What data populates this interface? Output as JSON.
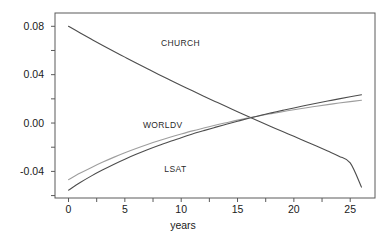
{
  "chart_data": {
    "type": "line",
    "title": "",
    "xlabel": "years",
    "ylabel": "",
    "xlim": [
      -1.2,
      27.2
    ],
    "ylim": [
      -0.062,
      0.091
    ],
    "grid": false,
    "legend": "inline-labels",
    "x_ticks": [
      0,
      5,
      10,
      15,
      20,
      25
    ],
    "x_tick_labels": [
      "0",
      "5",
      "10",
      "15",
      "20",
      "25"
    ],
    "x_minor_ticks": [
      2.5,
      7.5,
      12.5,
      17.5,
      22.5
    ],
    "y_ticks": [
      -0.04,
      0.0,
      0.04,
      0.08
    ],
    "y_tick_labels": [
      "-0.04",
      "0.00",
      "0.04",
      "0.08"
    ],
    "y_minor_ticks": [
      -0.06,
      -0.02,
      0.02,
      0.06
    ],
    "x": [
      0,
      1,
      2,
      3,
      4,
      5,
      6,
      7,
      8,
      9,
      10,
      11,
      12,
      13,
      14,
      15,
      16,
      17,
      18,
      19,
      20,
      21,
      22,
      23,
      24,
      25,
      26
    ],
    "series": [
      {
        "name": "CHURCH",
        "color": "#4d4d4d",
        "label_x": 8.2,
        "label_y": 0.0635,
        "values": [
          0.08,
          0.0747,
          0.0695,
          0.0644,
          0.0594,
          0.0545,
          0.0496,
          0.0449,
          0.0402,
          0.0356,
          0.0311,
          0.0266,
          0.0222,
          0.0179,
          0.0136,
          0.0094,
          0.0052,
          0.0011,
          -0.003,
          -0.007,
          -0.011,
          -0.015,
          -0.019,
          -0.0231,
          -0.0274,
          -0.033,
          -0.053
        ]
      },
      {
        "name": "WORLDV",
        "color": "#9e9e9e",
        "label_x": 6.6,
        "label_y": -0.0042,
        "values": [
          -0.0468,
          -0.0416,
          -0.0369,
          -0.0325,
          -0.0284,
          -0.0246,
          -0.0211,
          -0.0178,
          -0.0147,
          -0.0118,
          -0.0091,
          -0.0065,
          -0.0041,
          -0.0018,
          0.0003,
          0.0024,
          0.0043,
          0.0061,
          0.0078,
          0.0094,
          0.011,
          0.0125,
          0.0139,
          0.0152,
          0.0165,
          0.0177,
          0.0189
        ]
      },
      {
        "name": "LSAT",
        "color": "#4d4d4d",
        "label_x": 8.5,
        "label_y": -0.0405,
        "values": [
          -0.0555,
          -0.0494,
          -0.0439,
          -0.0389,
          -0.0342,
          -0.0299,
          -0.0259,
          -0.0221,
          -0.0186,
          -0.0153,
          -0.0121,
          -0.0091,
          -0.0063,
          -0.0036,
          -0.001,
          0.0015,
          0.0039,
          0.0062,
          0.0084,
          0.0105,
          0.0125,
          0.0145,
          0.0164,
          0.0182,
          0.02,
          0.0217,
          0.0234
        ]
      }
    ]
  },
  "geometry": {
    "plot_left": 55,
    "plot_right": 375,
    "plot_top": 13,
    "plot_bottom": 198,
    "tick_len": 4,
    "x_label_offset": 15,
    "y_label_offset": 7,
    "axis_title_y": 229
  },
  "colors": {
    "axis": "#5a5a5a",
    "text": "#1a1a1a",
    "background": "#ffffff",
    "series_dark": "#4d4d4d",
    "series_light": "#9e9e9e"
  }
}
